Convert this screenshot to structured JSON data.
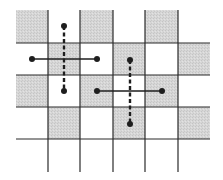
{
  "diagram": {
    "title": "",
    "grid": {
      "columns": 6,
      "rows": 4,
      "x_edges": [
        16,
        48,
        80,
        113,
        145,
        178,
        210
      ],
      "y_edges": [
        10,
        43,
        75,
        107,
        139
      ],
      "vertical_line_bottom": 172,
      "shaded_cells": [
        [
          0,
          0
        ],
        [
          0,
          2
        ],
        [
          0,
          4
        ],
        [
          1,
          1
        ],
        [
          1,
          3
        ],
        [
          1,
          5
        ],
        [
          2,
          0
        ],
        [
          2,
          2
        ],
        [
          2,
          4
        ],
        [
          3,
          1
        ],
        [
          3,
          3
        ],
        [
          3,
          5
        ]
      ],
      "shade_color": "#d3d3d3",
      "line_color": "#2a2a2a"
    },
    "crosses": [
      {
        "name": "cross-1",
        "center": [
          64,
          59
        ],
        "horizontal": {
          "x1": 32,
          "x2": 97,
          "y": 59,
          "style": "solid"
        },
        "vertical": {
          "x": 64,
          "y1": 26,
          "y2": 91,
          "style": "dashed"
        }
      },
      {
        "name": "cross-2",
        "center": [
          130,
          91
        ],
        "horizontal": {
          "x1": 97,
          "x2": 162,
          "y": 91,
          "style": "solid"
        },
        "vertical": {
          "x": 130,
          "y1": 60,
          "y2": 124,
          "style": "dashed"
        }
      }
    ],
    "mark_color": "#1e1e1e"
  }
}
